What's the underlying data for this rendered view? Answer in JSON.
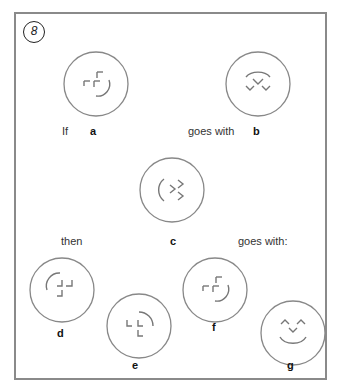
{
  "puzzle": {
    "number": "8",
    "text_if": "If",
    "text_goes_with_1": "goes with",
    "text_then": "then",
    "text_goes_with_2": "goes with:",
    "labels": {
      "a": "a",
      "b": "b",
      "c": "c",
      "d": "d",
      "e": "e",
      "f": "f",
      "g": "g"
    },
    "figures": [
      {
        "id": "a",
        "description": "circle with cross-like corner brackets and a smile arc on lower right"
      },
      {
        "id": "b",
        "description": "circle with an upper arc and three chevron (check) marks"
      },
      {
        "id": "c",
        "description": "circle with a left arc and two right-pointing chevrons"
      },
      {
        "id": "d",
        "description": "circle with an upper-left arc and corner brackets"
      },
      {
        "id": "e",
        "description": "circle with an upper-right arc and corner brackets"
      },
      {
        "id": "f",
        "description": "circle with corner brackets and a smile arc on lower right"
      },
      {
        "id": "g",
        "description": "circle with two caret marks, a chevron and a smile arc (face)"
      }
    ],
    "colors": {
      "frame": "#8a8a8a",
      "ring": "#888888",
      "glyph": "#777777",
      "text": "#333333"
    }
  }
}
